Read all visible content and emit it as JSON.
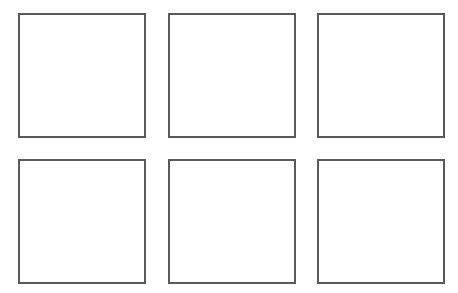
{
  "grid": {
    "rows": 2,
    "columns": 3,
    "border_color": "#5a5a5a",
    "background_color": "#ffffff",
    "boxes": [
      {
        "row": 1,
        "col": 1,
        "x": 18,
        "y": 13,
        "w": 128,
        "h": 125,
        "content": ""
      },
      {
        "row": 1,
        "col": 2,
        "x": 168,
        "y": 13,
        "w": 128,
        "h": 125,
        "content": ""
      },
      {
        "row": 1,
        "col": 3,
        "x": 317,
        "y": 13,
        "w": 128,
        "h": 125,
        "content": ""
      },
      {
        "row": 2,
        "col": 1,
        "x": 18,
        "y": 159,
        "w": 128,
        "h": 125,
        "content": ""
      },
      {
        "row": 2,
        "col": 2,
        "x": 168,
        "y": 159,
        "w": 128,
        "h": 125,
        "content": ""
      },
      {
        "row": 2,
        "col": 3,
        "x": 317,
        "y": 159,
        "w": 128,
        "h": 125,
        "content": ""
      }
    ]
  }
}
